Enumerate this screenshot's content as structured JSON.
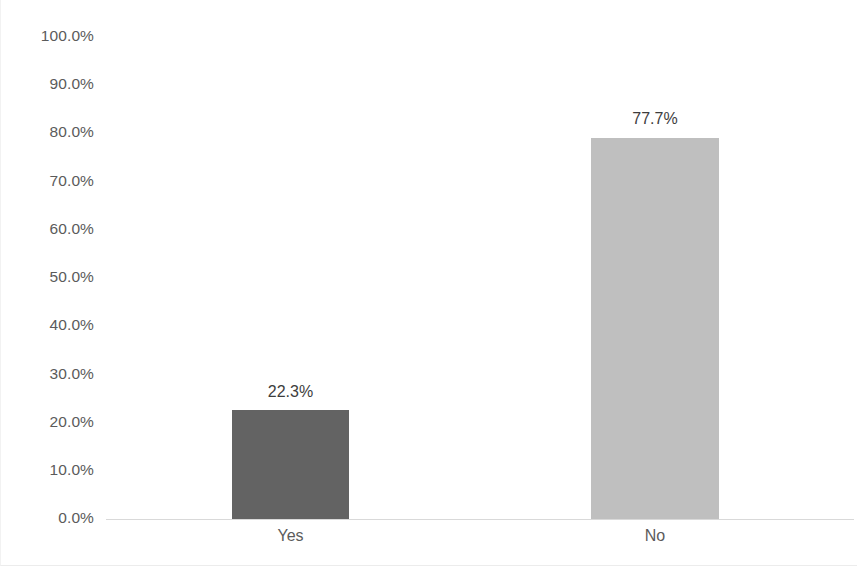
{
  "chart_data": {
    "type": "bar",
    "title": "",
    "subtitle": "",
    "xlabel": "",
    "ylabel": "",
    "categories": [
      "Yes",
      "No"
    ],
    "values": [
      22.3,
      77.7
    ],
    "value_labels": [
      "22.3%",
      "77.7%"
    ],
    "ylim": [
      0,
      100
    ],
    "y_tick_labels": [
      "100.0%",
      "90.0%",
      "80.0%",
      "70.0%",
      "60.0%",
      "50.0%",
      "40.0%",
      "30.0%",
      "20.0%",
      "10.0%",
      "0.0%"
    ],
    "y_tick_values": [
      100,
      90,
      80,
      70,
      60,
      50,
      40,
      30,
      20,
      10,
      0
    ],
    "grid": false,
    "legend": false,
    "legend_position": "none",
    "bar_colors": [
      "#636363",
      "#bfbfbf"
    ],
    "axis_color": "#d9d9d9",
    "tick_label_color": "#5b5b5b",
    "value_label_color": "#3d3d3d",
    "background": "#ffffff"
  }
}
